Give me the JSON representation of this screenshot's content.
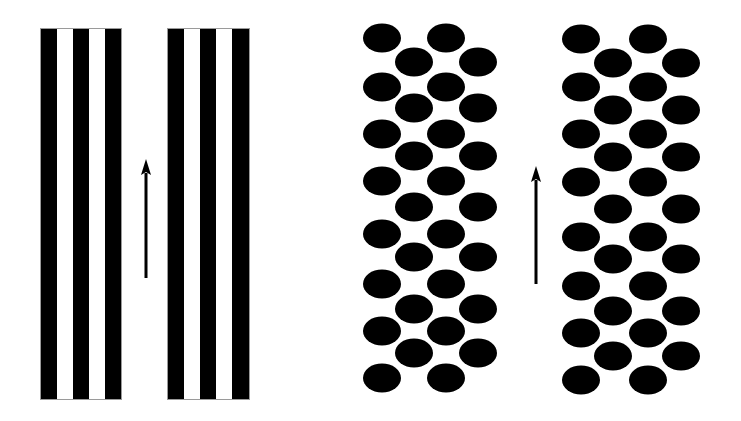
{
  "figure": {
    "background": "#ffffff",
    "ink": "#000000",
    "outline": "#9a9a9a",
    "panels": [
      {
        "id": "stripe-panel-left",
        "type": "stripes",
        "x": 41,
        "y": 29,
        "width": 80,
        "height": 370,
        "stripes": [
          {
            "x": 41,
            "w": 16,
            "fill": "black"
          },
          {
            "x": 57,
            "w": 16,
            "fill": "white"
          },
          {
            "x": 73,
            "w": 16,
            "fill": "black"
          },
          {
            "x": 89,
            "w": 16,
            "fill": "white"
          },
          {
            "x": 105,
            "w": 16,
            "fill": "black"
          }
        ]
      },
      {
        "id": "stripe-panel-right",
        "type": "stripes",
        "x": 168,
        "y": 29,
        "width": 81,
        "height": 370,
        "stripes": [
          {
            "x": 168,
            "w": 16,
            "fill": "black"
          },
          {
            "x": 184,
            "w": 16,
            "fill": "white"
          },
          {
            "x": 200,
            "w": 16,
            "fill": "black"
          },
          {
            "x": 216,
            "w": 16,
            "fill": "white"
          },
          {
            "x": 232,
            "w": 17,
            "fill": "black"
          }
        ]
      },
      {
        "id": "dot-panel-left",
        "type": "dots",
        "rx": 19,
        "ry": 14.5,
        "rows": [
          {
            "y": 38,
            "cx": [
              382,
              446
            ]
          },
          {
            "y": 62,
            "cx": [
              414,
              478
            ]
          },
          {
            "y": 87,
            "cx": [
              382,
              446
            ]
          },
          {
            "y": 108,
            "cx": [
              414,
              478
            ]
          },
          {
            "y": 134,
            "cx": [
              382,
              446
            ]
          },
          {
            "y": 156,
            "cx": [
              414,
              478
            ]
          },
          {
            "y": 181,
            "cx": [
              382,
              446
            ]
          },
          {
            "y": 207,
            "cx": [
              414,
              478
            ]
          },
          {
            "y": 234,
            "cx": [
              382,
              446
            ]
          },
          {
            "y": 257,
            "cx": [
              414,
              478
            ]
          },
          {
            "y": 284,
            "cx": [
              382,
              446
            ]
          },
          {
            "y": 309,
            "cx": [
              414,
              478
            ]
          },
          {
            "y": 331,
            "cx": [
              382,
              446
            ]
          },
          {
            "y": 353,
            "cx": [
              414,
              478
            ]
          },
          {
            "y": 378,
            "cx": [
              382,
              446
            ]
          }
        ]
      },
      {
        "id": "dot-panel-right",
        "type": "dots",
        "rx": 19,
        "ry": 14.5,
        "rows": [
          {
            "y": 39,
            "cx": [
              581,
              648
            ]
          },
          {
            "y": 63,
            "cx": [
              613,
              681
            ]
          },
          {
            "y": 87,
            "cx": [
              581,
              648
            ]
          },
          {
            "y": 110,
            "cx": [
              613,
              681
            ]
          },
          {
            "y": 134,
            "cx": [
              581,
              648
            ]
          },
          {
            "y": 157,
            "cx": [
              613,
              681
            ]
          },
          {
            "y": 182,
            "cx": [
              581,
              648
            ]
          },
          {
            "y": 209,
            "cx": [
              613,
              681
            ]
          },
          {
            "y": 237,
            "cx": [
              581,
              648
            ]
          },
          {
            "y": 259,
            "cx": [
              613,
              681
            ]
          },
          {
            "y": 286,
            "cx": [
              581,
              648
            ]
          },
          {
            "y": 311,
            "cx": [
              613,
              681
            ]
          },
          {
            "y": 333,
            "cx": [
              581,
              648
            ]
          },
          {
            "y": 356,
            "cx": [
              613,
              681
            ]
          },
          {
            "y": 380,
            "cx": [
              581,
              648
            ]
          }
        ]
      }
    ],
    "arrows": [
      {
        "id": "arrow-up-stripes",
        "direction": "up",
        "x": 146,
        "tip_y": 159,
        "head_bottom_y": 175,
        "tail_y": 278,
        "head_half_width": 5,
        "shaft_width": 3
      },
      {
        "id": "arrow-up-dots",
        "direction": "up",
        "x": 536,
        "tip_y": 166,
        "head_bottom_y": 182,
        "tail_y": 284,
        "head_half_width": 5,
        "shaft_width": 3
      }
    ]
  }
}
